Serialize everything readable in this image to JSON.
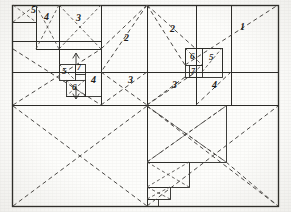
{
  "figure": {
    "width": 291,
    "height": 212,
    "background_color": "#fdfdfb",
    "solid_line_color": "#2b2a27",
    "dashed_line_color": "#4a4845",
    "label_color": "#1c1b19"
  },
  "labels": [
    {
      "id": "label-top-left-5",
      "text": "5",
      "x": 31,
      "y": 5,
      "size": 10
    },
    {
      "id": "label-top-4",
      "text": "4",
      "x": 44,
      "y": 12,
      "size": 10
    },
    {
      "id": "label-top-3",
      "text": "3",
      "x": 76,
      "y": 13,
      "size": 10
    },
    {
      "id": "label-upper-mid-2",
      "text": "2",
      "x": 124,
      "y": 33,
      "size": 10
    },
    {
      "id": "label-upper-right-2",
      "text": "2",
      "x": 170,
      "y": 24,
      "size": 10
    },
    {
      "id": "label-upper-right-1",
      "text": "1",
      "x": 240,
      "y": 22,
      "size": 10
    },
    {
      "id": "label-mid-left-5",
      "text": "5",
      "x": 62,
      "y": 71,
      "size": 9
    },
    {
      "id": "label-mid-left-7",
      "text": "7",
      "x": 75,
      "y": 68,
      "size": 8
    },
    {
      "id": "label-mid-left-6",
      "text": "6",
      "x": 72,
      "y": 87,
      "size": 9
    },
    {
      "id": "label-mid-4",
      "text": "4",
      "x": 91,
      "y": 79,
      "size": 10
    },
    {
      "id": "label-center-3",
      "text": "3",
      "x": 128,
      "y": 79,
      "size": 10
    },
    {
      "id": "label-right-3",
      "text": "3",
      "x": 172,
      "y": 84,
      "size": 10
    },
    {
      "id": "label-right-6",
      "text": "6",
      "x": 190,
      "y": 56,
      "size": 9
    },
    {
      "id": "label-right-5",
      "text": "5",
      "x": 212,
      "y": 57,
      "size": 9
    },
    {
      "id": "label-right-7",
      "text": "7",
      "x": 192,
      "y": 73,
      "size": 8
    },
    {
      "id": "label-right-4",
      "text": "4",
      "x": 212,
      "y": 84,
      "size": 10
    }
  ],
  "geometry": {
    "outer_rect": {
      "x": 12,
      "y": 5,
      "width": 267,
      "height": 202
    },
    "description": "Nested rectangle dissection with solid partition lines and dashed diagonal construction lines"
  }
}
